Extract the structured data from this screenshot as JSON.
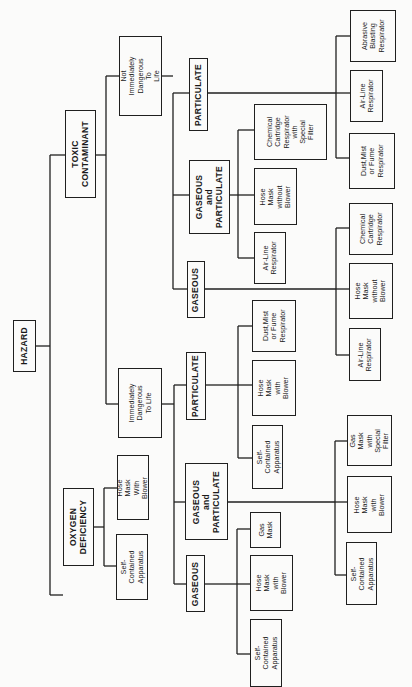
{
  "diagram": {
    "orientation": "rotated-90-ccw",
    "root": {
      "id": "hazard",
      "label": "HAZARD"
    },
    "nodes": {
      "hazard": "HAZARD",
      "toxic": "TOXIC\nCONTAMINANT",
      "oxygen": "OXYGEN\nDEFICIENCY",
      "nidl": "Not Immediately\nDangerous To\nLife",
      "idl": "Immediately\nDangerous\nTo Life",
      "ox_hose": "Hose Mask\nWith Blower",
      "ox_sca": "Self-Contained\nApparatus",
      "nid_part": "PARTICULATE",
      "nid_gp": "GASEOUS\nand\nPARTICULATE",
      "nid_gas": "GASEOUS",
      "nid_part_abr": "Abrasive\nBlasting\nRespirator",
      "nid_part_air": "Air-Line\nRespirator",
      "nid_part_dust": "Dust,Mist\nor Fume\nRespirator",
      "nid_gp_chem": "Chemical\nCartridge\nRespirator\nwith\nSpecial\nFilter",
      "nid_gp_hose": "Hose Mask\nwithout\nBlower",
      "nid_gp_air": "Air-Line\nRespirator",
      "nid_gas_chem": "Chemical\nCartridge\nRespirator",
      "nid_gas_hose": "Hose Mask\nwithout\nBlower",
      "nid_gas_air": "Air-Line\nRespirator",
      "idl_part": "PARTICULATE",
      "idl_gp": "GASEOUS\nand\nPARTICULATE",
      "idl_gas": "GASEOUS",
      "idl_part_dust": "Dust,Mist\nor Fume\nRespirator",
      "idl_part_hose": "Hose Mask\nwith\nBlower",
      "idl_part_sca": "Self-Contained\nApparatus",
      "idl_gp_gasmask": "Gas Mask\nwith\nSpecial\nFilter",
      "idl_gp_hose": "Hose Mask\nwith\nBlower",
      "idl_gp_sca": "Self-Contained\nApparatus",
      "idl_gas_gasmask": "Gas\nMask",
      "idl_gas_hose": "Hose Mask\nwith\nBlower",
      "idl_gas_sca": "Self-Contained\nApparatus"
    },
    "edges": [
      [
        "hazard",
        "toxic"
      ],
      [
        "hazard",
        "oxygen"
      ],
      [
        "toxic",
        "nidl"
      ],
      [
        "toxic",
        "idl"
      ],
      [
        "oxygen",
        "ox_hose"
      ],
      [
        "oxygen",
        "ox_sca"
      ],
      [
        "nidl",
        "nid_part"
      ],
      [
        "nidl",
        "nid_gp"
      ],
      [
        "nidl",
        "nid_gas"
      ],
      [
        "nid_part",
        "nid_part_abr"
      ],
      [
        "nid_part",
        "nid_part_air"
      ],
      [
        "nid_part",
        "nid_part_dust"
      ],
      [
        "nid_gp",
        "nid_gp_chem"
      ],
      [
        "nid_gp",
        "nid_gp_hose"
      ],
      [
        "nid_gp",
        "nid_gp_air"
      ],
      [
        "nid_gas",
        "nid_gas_chem"
      ],
      [
        "nid_gas",
        "nid_gas_hose"
      ],
      [
        "nid_gas",
        "nid_gas_air"
      ],
      [
        "idl",
        "idl_part"
      ],
      [
        "idl",
        "idl_gp"
      ],
      [
        "idl",
        "idl_gas"
      ],
      [
        "idl_part",
        "idl_part_dust"
      ],
      [
        "idl_part",
        "idl_part_hose"
      ],
      [
        "idl_part",
        "idl_part_sca"
      ],
      [
        "idl_gp",
        "idl_gp_gasmask"
      ],
      [
        "idl_gp",
        "idl_gp_hose"
      ],
      [
        "idl_gp",
        "idl_gp_sca"
      ],
      [
        "idl_gas",
        "idl_gas_gasmask"
      ],
      [
        "idl_gas",
        "idl_gas_hose"
      ],
      [
        "idl_gas",
        "idl_gas_sca"
      ]
    ]
  }
}
